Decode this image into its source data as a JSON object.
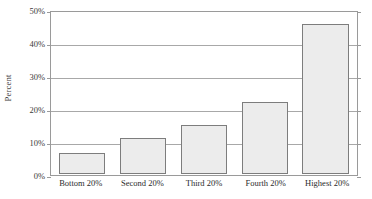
{
  "chart_data": {
    "type": "bar",
    "title": "",
    "subtitle": "",
    "xlabel": "",
    "ylabel": "Percent",
    "categories": [
      "Bottom 20%",
      "Second 20%",
      "Third 20%",
      "Fourth 20%",
      "Highest 20%"
    ],
    "values": [
      6.5,
      11,
      15,
      22,
      46
    ],
    "value_unit": "%",
    "ylim": [
      0,
      50
    ],
    "ytick_values": [
      0,
      10,
      20,
      30,
      40,
      50
    ],
    "ytick_labels": [
      "0%",
      "10%",
      "20%",
      "30%",
      "40%",
      "50%"
    ],
    "grid": true,
    "grid_axis": "y",
    "legend": false,
    "legend_position": "none",
    "annotations": [],
    "bar_fill_color": "#ececec",
    "bar_border_color": "#7d7d7d",
    "axis_color": "#9a9a9a",
    "gridline_color": "#a8a8a8",
    "background_color": "#ffffff",
    "series": [
      {
        "name": "Percent",
        "values": [
          6.5,
          11,
          15,
          22,
          46
        ]
      }
    ]
  }
}
